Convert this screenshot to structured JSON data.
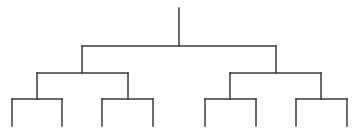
{
  "diagram": {
    "type": "tree",
    "stroke_color": "#3a3a3a",
    "background": "#ffffff",
    "stroke_width": 1.5,
    "root": {
      "x": 179,
      "y_top": 8,
      "y_join": 46
    },
    "levels": [
      {
        "level": 1,
        "y": 46,
        "brackets": [
          {
            "left": 82,
            "right": 276,
            "parent_x": 179
          }
        ]
      },
      {
        "level": 2,
        "y": 73,
        "brackets": [
          {
            "left": 37,
            "right": 128,
            "parent_x": 82
          },
          {
            "left": 230,
            "right": 321,
            "parent_x": 276
          }
        ]
      },
      {
        "level": 3,
        "y": 99,
        "brackets": [
          {
            "left": 12,
            "right": 62,
            "parent_x": 37
          },
          {
            "left": 102,
            "right": 153,
            "parent_x": 128
          },
          {
            "left": 205,
            "right": 256,
            "parent_x": 230
          },
          {
            "left": 296,
            "right": 347,
            "parent_x": 321
          }
        ]
      }
    ],
    "leaf_bottom_y": 126,
    "leaf_count": 8
  }
}
